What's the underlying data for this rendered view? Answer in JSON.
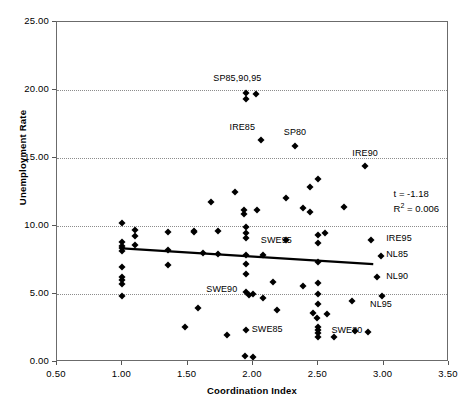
{
  "chart_data": {
    "type": "scatter",
    "title": "",
    "xlabel": "Coordination Index",
    "ylabel": "Unemployment Rate",
    "xlim": [
      0.5,
      3.5
    ],
    "ylim": [
      0.0,
      25.0
    ],
    "xticks": [
      "0.50",
      "1.00",
      "1.50",
      "2.00",
      "2.50",
      "3.00",
      "3.50"
    ],
    "xtick_values": [
      0.5,
      1.0,
      1.5,
      2.0,
      2.5,
      3.0,
      3.5
    ],
    "yticks": [
      "0.00",
      "5.00",
      "10.00",
      "15.00",
      "20.00",
      "25.00"
    ],
    "ytick_values": [
      0,
      5,
      10,
      15,
      20,
      25
    ],
    "grid": "horizontal-dotted",
    "legend": "none",
    "marker": "filled-diamond",
    "marker_color": "#000000",
    "annotations": {
      "t_statistic": "t = -1.18",
      "r_squared_prefix": "R",
      "r_squared_exp": "2",
      "r_squared_value": " = 0.006"
    },
    "trendline": {
      "type": "linear",
      "color": "#000000",
      "width": 2.2,
      "x_start": 1.0,
      "y_start": 8.35,
      "x_end": 2.92,
      "y_end": 7.2
    },
    "points": [
      {
        "x": 1.0,
        "y": 10.25
      },
      {
        "x": 1.0,
        "y": 8.85
      },
      {
        "x": 1.0,
        "y": 8.55
      },
      {
        "x": 1.0,
        "y": 8.35
      },
      {
        "x": 1.0,
        "y": 8.15
      },
      {
        "x": 1.0,
        "y": 6.95
      },
      {
        "x": 1.0,
        "y": 6.25
      },
      {
        "x": 1.0,
        "y": 6.0
      },
      {
        "x": 1.0,
        "y": 5.75
      },
      {
        "x": 1.0,
        "y": 4.85
      },
      {
        "x": 1.1,
        "y": 9.7
      },
      {
        "x": 1.1,
        "y": 9.25
      },
      {
        "x": 1.1,
        "y": 8.6
      },
      {
        "x": 1.35,
        "y": 9.55
      },
      {
        "x": 1.35,
        "y": 8.2
      },
      {
        "x": 1.35,
        "y": 7.1
      },
      {
        "x": 1.48,
        "y": 2.55
      },
      {
        "x": 1.55,
        "y": 9.65
      },
      {
        "x": 1.55,
        "y": 9.55
      },
      {
        "x": 1.58,
        "y": 3.95
      },
      {
        "x": 1.62,
        "y": 8.05
      },
      {
        "x": 1.68,
        "y": 11.8
      },
      {
        "x": 1.73,
        "y": 9.6
      },
      {
        "x": 1.73,
        "y": 7.95
      },
      {
        "x": 1.8,
        "y": 1.95
      },
      {
        "x": 1.86,
        "y": 12.5
      },
      {
        "x": 1.93,
        "y": 10.85
      },
      {
        "x": 1.93,
        "y": 11.2
      },
      {
        "x": 1.95,
        "y": 19.75
      },
      {
        "x": 1.95,
        "y": 19.35
      },
      {
        "x": 1.95,
        "y": 9.95
      },
      {
        "x": 1.95,
        "y": 9.5
      },
      {
        "x": 1.95,
        "y": 9.1
      },
      {
        "x": 1.95,
        "y": 7.85
      },
      {
        "x": 1.95,
        "y": 7.2
      },
      {
        "x": 1.95,
        "y": 6.45
      },
      {
        "x": 1.95,
        "y": 5.15
      },
      {
        "x": 1.97,
        "y": 4.95
      },
      {
        "x": 2.0,
        "y": 5.0
      },
      {
        "x": 1.95,
        "y": 2.35
      },
      {
        "x": 1.94,
        "y": 0.45
      },
      {
        "x": 2.0,
        "y": 0.4
      },
      {
        "x": 2.02,
        "y": 19.7
      },
      {
        "x": 2.03,
        "y": 11.15
      },
      {
        "x": 2.06,
        "y": 16.35
      },
      {
        "x": 2.08,
        "y": 7.9
      },
      {
        "x": 2.08,
        "y": 4.7
      },
      {
        "x": 2.15,
        "y": 5.9
      },
      {
        "x": 2.18,
        "y": 3.8
      },
      {
        "x": 2.25,
        "y": 12.05
      },
      {
        "x": 2.25,
        "y": 9.0
      },
      {
        "x": 2.32,
        "y": 15.85
      },
      {
        "x": 2.38,
        "y": 11.3
      },
      {
        "x": 2.38,
        "y": 5.6
      },
      {
        "x": 2.44,
        "y": 12.85
      },
      {
        "x": 2.44,
        "y": 11.05
      },
      {
        "x": 2.46,
        "y": 3.6
      },
      {
        "x": 2.49,
        "y": 3.25
      },
      {
        "x": 2.5,
        "y": 13.45
      },
      {
        "x": 2.5,
        "y": 9.35
      },
      {
        "x": 2.5,
        "y": 8.75
      },
      {
        "x": 2.5,
        "y": 7.35
      },
      {
        "x": 2.5,
        "y": 5.8
      },
      {
        "x": 2.5,
        "y": 5.0
      },
      {
        "x": 2.5,
        "y": 4.25
      },
      {
        "x": 2.5,
        "y": 2.6
      },
      {
        "x": 2.5,
        "y": 2.35
      },
      {
        "x": 2.5,
        "y": 2.1
      },
      {
        "x": 2.5,
        "y": 1.85
      },
      {
        "x": 2.55,
        "y": 9.45
      },
      {
        "x": 2.57,
        "y": 3.5
      },
      {
        "x": 2.62,
        "y": 1.85
      },
      {
        "x": 2.7,
        "y": 11.4
      },
      {
        "x": 2.76,
        "y": 4.5
      },
      {
        "x": 2.78,
        "y": 2.25
      },
      {
        "x": 2.86,
        "y": 14.4
      },
      {
        "x": 2.88,
        "y": 2.2
      },
      {
        "x": 2.9,
        "y": 9.0
      },
      {
        "x": 2.95,
        "y": 6.25
      },
      {
        "x": 2.98,
        "y": 7.8
      },
      {
        "x": 2.99,
        "y": 4.85
      }
    ],
    "point_labels": [
      {
        "text": "SP85,90,95",
        "x": 1.88,
        "y": 20.9,
        "anchor": "middle"
      },
      {
        "text": "IRE85",
        "x": 1.92,
        "y": 17.3,
        "anchor": "middle"
      },
      {
        "text": "SP80",
        "x": 2.32,
        "y": 16.9,
        "anchor": "middle"
      },
      {
        "text": "IRE90",
        "x": 2.86,
        "y": 15.4,
        "anchor": "middle"
      },
      {
        "text": "SWE95",
        "x": 2.06,
        "y": 8.95,
        "anchor": "start"
      },
      {
        "text": "IRE95",
        "x": 3.02,
        "y": 9.1,
        "anchor": "start"
      },
      {
        "text": "NL85",
        "x": 3.02,
        "y": 7.95,
        "anchor": "start"
      },
      {
        "text": "NL90",
        "x": 3.02,
        "y": 6.35,
        "anchor": "start"
      },
      {
        "text": "SWE90",
        "x": 1.88,
        "y": 5.35,
        "anchor": "end"
      },
      {
        "text": "NL95",
        "x": 2.98,
        "y": 4.3,
        "anchor": "middle"
      },
      {
        "text": "SWE85",
        "x": 1.99,
        "y": 2.45,
        "anchor": "start"
      },
      {
        "text": "SWE80",
        "x": 2.6,
        "y": 2.35,
        "anchor": "start"
      }
    ]
  }
}
